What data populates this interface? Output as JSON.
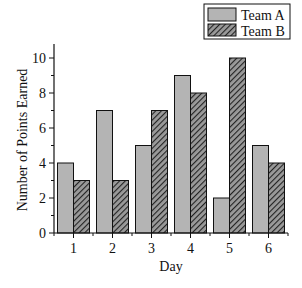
{
  "chart_data": {
    "type": "bar",
    "title": "",
    "xlabel": "Day",
    "ylabel": "Number of Points Earned",
    "categories": [
      "1",
      "2",
      "3",
      "4",
      "5",
      "6"
    ],
    "series": [
      {
        "name": "Team A",
        "values": [
          4,
          7,
          5,
          9,
          2,
          5
        ],
        "fill": "#b4b4b4",
        "pattern": "solid"
      },
      {
        "name": "Team B",
        "values": [
          3,
          3,
          7,
          8,
          10,
          4
        ],
        "fill": "#555555",
        "pattern": "hatch"
      }
    ],
    "ylim": [
      0,
      10.8
    ],
    "yticks": [
      0,
      2,
      4,
      6,
      8,
      10
    ],
    "grid": false,
    "legend": {
      "position": "top-right",
      "entries": [
        "Team A",
        "Team B"
      ]
    }
  }
}
